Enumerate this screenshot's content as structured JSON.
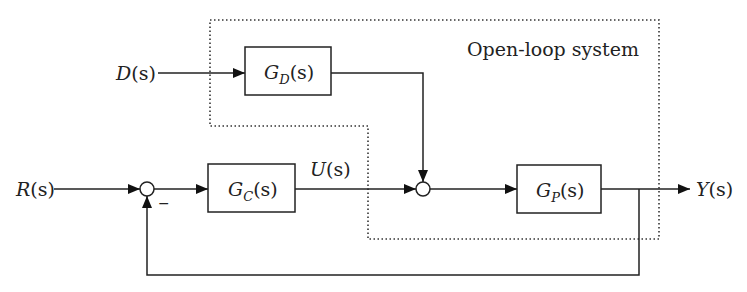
{
  "diagram": {
    "type": "block-diagram",
    "title_region": {
      "label": "Open-loop system",
      "style": "dotted-boundary"
    },
    "signals": {
      "reference": {
        "symbol": "R",
        "arg": "(s)"
      },
      "disturbance": {
        "symbol": "D",
        "arg": "(s)"
      },
      "control": {
        "symbol": "U",
        "arg": "(s)"
      },
      "output": {
        "symbol": "Y",
        "arg": "(s)"
      }
    },
    "blocks": {
      "controller": {
        "symbol": "G",
        "subscript": "C",
        "arg": "(s)"
      },
      "disturbance_tf": {
        "symbol": "G",
        "subscript": "D",
        "arg": "(s)"
      },
      "plant": {
        "symbol": "G",
        "subscript": "P",
        "arg": "(s)"
      }
    },
    "summing_junctions": {
      "error": {
        "feedback_sign": "−"
      },
      "disturbance_sum": {
        "feedback_sign": ""
      }
    },
    "colors": {
      "line": "#222222",
      "background": "#ffffff"
    }
  }
}
